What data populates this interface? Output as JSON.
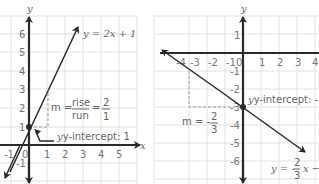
{
  "left_graph": {
    "axis_labels": {
      "x": "x",
      "y": "y"
    },
    "x_ticks": [
      "-1",
      "0",
      "1",
      "2",
      "3",
      "4",
      "5"
    ],
    "y_ticks": [
      "6",
      "5",
      "4",
      "3",
      "2",
      "1",
      "-1"
    ],
    "equation": "y = 2x + 1",
    "slope_label": "m =",
    "slope_rise": "rise",
    "slope_run": "run",
    "slope_equals": "=",
    "slope_num": "2",
    "slope_den": "1",
    "intercept_label": "y-intercept: 1",
    "line_color": "#2a2a2a"
  },
  "right_graph": {
    "axis_labels": {
      "x": "x",
      "y": "y"
    },
    "x_ticks": [
      "-4",
      "-3",
      "-2",
      "-1",
      "0",
      "1",
      "2",
      "3",
      "4"
    ],
    "y_ticks": [
      "1",
      "-1",
      "-2",
      "-3",
      "-4",
      "-5",
      "-6"
    ],
    "equation_prefix": "y = -",
    "equation_num": "2",
    "equation_den": "3",
    "equation_suffix": "x −",
    "slope_label": "m = -",
    "slope_num": "2",
    "slope_den": "3",
    "intercept_label": "y-intercept: -3",
    "line_color": "#2a2a2a"
  }
}
